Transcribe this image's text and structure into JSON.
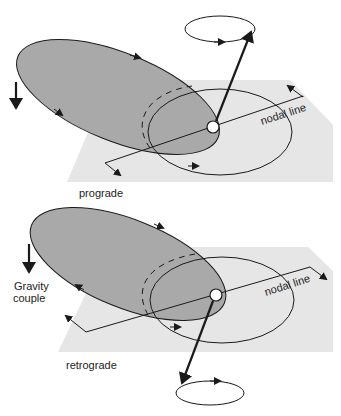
{
  "figure": {
    "panels": [
      {
        "id": "prograde",
        "label": "prograde",
        "nodal_line_label": "nodal line"
      },
      {
        "id": "retrograde",
        "label": "retrograde",
        "nodal_line_label": "nodal line",
        "force_label_line1": "Gravity",
        "force_label_line2": "couple"
      }
    ],
    "colors": {
      "plane": "#e6e6e6",
      "tilted_orbit": "#a9a9a9",
      "stroke": "#1a1a1a",
      "background": "#ffffff"
    }
  }
}
